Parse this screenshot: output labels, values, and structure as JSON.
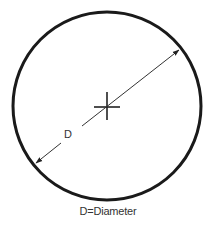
{
  "diagram": {
    "label_d": "D",
    "caption": "D=Diameter",
    "circle": {
      "cx": 107,
      "cy": 106,
      "r": 94,
      "stroke": "#1a1a1a"
    },
    "center_mark": {
      "x": 107,
      "y": 107
    },
    "diameter_line": {
      "from": [
        36,
        163
      ],
      "to": [
        179,
        50
      ],
      "color": "#333333"
    }
  }
}
